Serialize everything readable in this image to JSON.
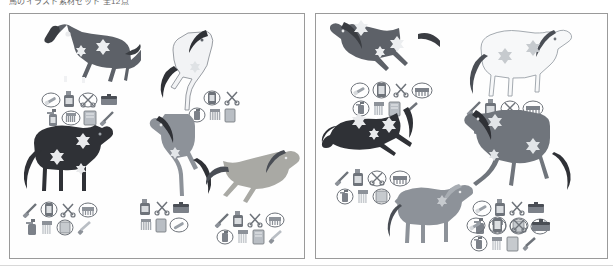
{
  "header": {
    "title": "馬のイラスト素材セット 全12点"
  },
  "palette": {
    "border": "#9a9a9a",
    "background": "#ffffff",
    "dark_bay": "#5d6168",
    "black": "#2f3136",
    "grey": "#8d9299",
    "light_grey": "#b9bec4",
    "white_horse": "#f2f3f5",
    "palomino": "#a9a9a4",
    "icon_grey": "#7c8189",
    "icon_dark": "#4a4e55",
    "icon_light": "#c6cace",
    "outline": "#6e737a"
  },
  "panels": [
    {
      "name": "left-panel",
      "groups": [
        {
          "id": "horse-1",
          "label": "dark-bay-trotting-horse",
          "pose": "trotting",
          "coat": "dark-bay",
          "coat_color": "#5d6168",
          "mane_color": "#3a3d42",
          "markings": "white star and blaze",
          "tray": {
            "rows": [
              [
                "oval-brush-icon",
                "bottle-icon",
                "oval-scissors-icon",
                "grooming-box-icon"
              ],
              [
                "spray-bottle-icon",
                "oval-comb-icon",
                "towel-icon",
                "hoof-pick-icon"
              ]
            ]
          }
        },
        {
          "id": "horse-2",
          "label": "white-rearing-horse",
          "pose": "rearing",
          "coat": "white",
          "coat_color": "#f2f3f5",
          "mane_color": "#2f3136",
          "markings": "dark mane and tail",
          "tray": {
            "rows": [
              [
                "bottle-icon",
                "oval-scissors-icon",
                "grooming-box-icon"
              ],
              [
                "oval-spray-icon",
                "comb-icon",
                "towel-icon"
              ]
            ]
          }
        },
        {
          "id": "horse-3",
          "label": "black-standing-horse",
          "pose": "standing",
          "coat": "black",
          "coat_color": "#2f3136",
          "mane_color": "#2f3136",
          "markings": "white flower spots",
          "tray": {
            "rows": [
              [
                "hoof-pick-icon",
                "oval-bottle-icon",
                "scissors-icon",
                "oval-comb-icon"
              ],
              [
                "spray-bottle-icon",
                "brush-icon",
                "oval-towel-icon",
                "file-icon"
              ]
            ]
          }
        },
        {
          "id": "horse-4",
          "label": "grey-rearing-horse",
          "pose": "rearing",
          "coat": "grey",
          "coat_color": "#8d9299",
          "mane_color": "#2f3136",
          "markings": "dark mane and tail",
          "tray": {
            "rows": [
              [
                "bottle-icon",
                "scissors-icon",
                "grooming-box-icon"
              ],
              [
                "comb-icon",
                "towel-icon",
                "oval-brush-icon"
              ]
            ]
          }
        },
        {
          "id": "horse-5",
          "label": "palomino-galloping-horse",
          "pose": "galloping",
          "coat": "palomino",
          "coat_color": "#a9a9a4",
          "mane_color": "#4a4e55",
          "markings": "dark mane and tail",
          "tray": {
            "rows": [
              [
                "hoof-pick-icon",
                "bottle-icon",
                "scissors-icon",
                "oval-comb-icon"
              ],
              [
                "oval-spray-icon",
                "brush-icon",
                "towel-icon",
                "file-icon"
              ]
            ]
          }
        }
      ]
    },
    {
      "name": "right-panel",
      "groups": [
        {
          "id": "horse-6",
          "label": "dark-bay-galloping-horse",
          "pose": "galloping",
          "coat": "dark-bay",
          "coat_color": "#5d6168",
          "mane_color": "#3a3d42",
          "markings": "white flower spots",
          "tray": {
            "rows": [
              [
                "oval-brush-icon",
                "oval-bottle-icon",
                "scissors-icon",
                "oval-comb-icon"
              ],
              [
                "oval-spray-icon",
                "comb-icon",
                "towel-icon",
                "hoof-pick-icon"
              ]
            ]
          }
        },
        {
          "id": "horse-7",
          "label": "white-trotting-horse",
          "pose": "trotting",
          "coat": "white",
          "coat_color": "#f7f8f9",
          "mane_color": "#4a4e55",
          "markings": "outlined white coat",
          "tray": {
            "rows": [
              [
                "hoof-pick-icon",
                "bottle-icon",
                "oval-scissors-icon",
                "oval-comb-icon"
              ],
              [
                "spray-bottle-icon",
                "oval-brush-icon",
                "oval-towel-icon",
                "file-icon"
              ]
            ]
          }
        },
        {
          "id": "horse-8",
          "label": "black-galloping-horse",
          "pose": "galloping",
          "coat": "black",
          "coat_color": "#2f3136",
          "mane_color": "#2f3136",
          "markings": "white flower spots",
          "tray": {
            "rows": [
              [
                "hoof-pick-icon",
                "bottle-icon",
                "oval-scissors-icon",
                "oval-comb-icon"
              ],
              [
                "oval-spray-icon",
                "brush-icon",
                "oval-towel-icon",
                "file-icon"
              ]
            ]
          }
        },
        {
          "id": "horse-9",
          "label": "grey-dapple-trotting-horse",
          "pose": "trotting",
          "coat": "grey",
          "coat_color": "#70757c",
          "mane_color": "#2f3136",
          "markings": "white flower spots",
          "tray": {
            "rows": [
              [
                "oval-brush-icon",
                "bottle-icon",
                "scissors-icon",
                "grooming-box-icon"
              ],
              [
                "spray-bottle-icon",
                "oval-comb-icon",
                "oval-towel-icon",
                "oval-file-icon"
              ]
            ]
          }
        },
        {
          "id": "horse-10",
          "label": "grey-standing-horse",
          "pose": "standing",
          "coat": "grey",
          "coat_color": "#8d9299",
          "mane_color": "#4a4e55",
          "markings": "light mane",
          "tray": {
            "rows": [
              [
                "oval-brush-icon",
                "oval-bottle-icon",
                "oval-scissors-icon",
                "grooming-box-icon"
              ],
              [
                "oval-spray-icon",
                "comb-icon",
                "towel-icon",
                "hoof-pick-icon"
              ]
            ]
          }
        }
      ]
    }
  ]
}
